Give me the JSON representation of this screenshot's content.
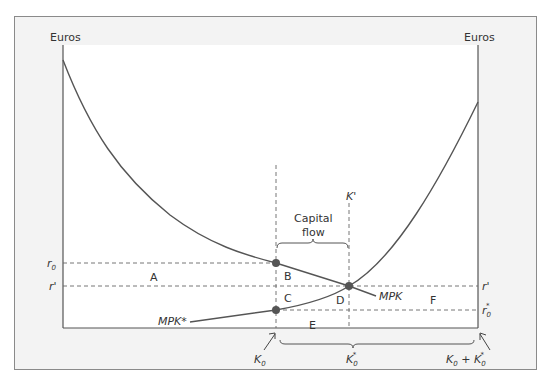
{
  "figure": {
    "left_axis_label": "Euros",
    "right_axis_label": "Euros",
    "capital_flow_label_line1": "Capital",
    "capital_flow_label_line2": "flow",
    "k_prime_label": "K'",
    "mpk_label": "MPK",
    "mpk_star_label": "MPK*",
    "rate_labels": {
      "r0": "r",
      "r0_sub": "0",
      "r_prime_left": "r'",
      "r_prime_right": "r'",
      "r0_star": "r",
      "r0_star_sub": "0",
      "r0_star_sup": "*"
    },
    "area_labels": {
      "A": "A",
      "B": "B",
      "C": "C",
      "D": "D",
      "E": "E",
      "F": "F"
    },
    "bottom_labels": {
      "k0": "K",
      "k0_sub": "0",
      "k0_star": "K",
      "k0_star_sub": "0",
      "k0_star_sup": "*",
      "total": "K",
      "total_sub": "0",
      "total_plus": " + K",
      "total_sub2": "0",
      "total_sup": "*"
    },
    "colors": {
      "frame_bg": "#f3f3f3",
      "frame_border": "#8a8a8a",
      "plot_bg": "#ffffff",
      "line": "#555555",
      "dot": "#555555",
      "text": "#333333"
    }
  }
}
